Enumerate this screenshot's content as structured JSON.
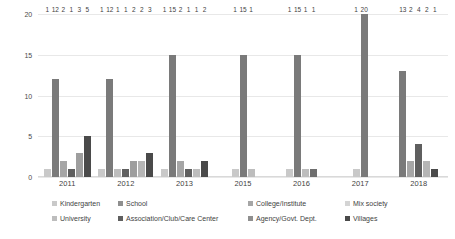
{
  "chart_data": {
    "type": "bar",
    "title": "",
    "xlabel": "",
    "ylabel": "",
    "ylim": [
      0,
      20
    ],
    "yticks": [
      "0",
      "5",
      "10",
      "15",
      "20"
    ],
    "grid": true,
    "legend_position": "bottom",
    "categories": [
      "2011",
      "2012",
      "2013",
      "2015",
      "2016",
      "2017",
      "2018"
    ],
    "series": [
      {
        "name": "Kindergarten",
        "color": "#c9c9c9",
        "values": [
          1,
          1,
          1,
          1,
          1,
          1,
          0
        ]
      },
      {
        "name": "School",
        "color": "#7a7a7a",
        "values": [
          12,
          12,
          15,
          15,
          15,
          20,
          13
        ]
      },
      {
        "name": "College/Institute",
        "color": "#a6a6a6",
        "values": [
          2,
          1,
          2,
          1,
          1,
          0,
          2
        ]
      },
      {
        "name": "Mix society",
        "color": "#d4d4d4",
        "values": [
          0,
          0,
          0,
          0,
          0,
          0,
          0
        ]
      },
      {
        "name": "University",
        "color": "#bdbdbd",
        "values": [
          0,
          0,
          0,
          0,
          0,
          0,
          0
        ]
      },
      {
        "name": "Association/Club/Care Center",
        "color": "#6e6e6e",
        "values": [
          1,
          1,
          1,
          0,
          1,
          0,
          4
        ]
      },
      {
        "name": "Agency/Govt. Dept.",
        "color": "#8f8f8f",
        "values": [
          3,
          2,
          1,
          0,
          0,
          0,
          2
        ]
      },
      {
        "name": "Villages",
        "color": "#4a4a4a",
        "values": [
          5,
          3,
          2,
          0,
          0,
          0,
          1
        ]
      }
    ],
    "groups": [
      {
        "category": "2011",
        "bars": [
          {
            "series": "Kindergarten",
            "value": 1,
            "color": "#c9c9c9"
          },
          {
            "series": "School",
            "value": 12,
            "color": "#7a7a7a"
          },
          {
            "series": "College/Institute",
            "value": 2,
            "color": "#a6a6a6"
          },
          {
            "series": "Association/Club/Care Center",
            "value": 1,
            "color": "#5f5f5f"
          },
          {
            "series": "Agency/Govt. Dept.",
            "value": 3,
            "color": "#9e9e9e"
          },
          {
            "series": "Villages",
            "value": 5,
            "color": "#4a4a4a"
          }
        ]
      },
      {
        "category": "2012",
        "bars": [
          {
            "series": "Kindergarten",
            "value": 1,
            "color": "#c9c9c9"
          },
          {
            "series": "School",
            "value": 12,
            "color": "#7a7a7a"
          },
          {
            "series": "College/Institute",
            "value": 1,
            "color": "#bdbdbd"
          },
          {
            "series": "Association/Club/Care Center",
            "value": 1,
            "color": "#5f5f5f"
          },
          {
            "series": "Agency/Govt. Dept.",
            "value": 2,
            "color": "#9e9e9e"
          },
          {
            "series": "Mix society",
            "value": 2,
            "color": "#b5b5b5"
          },
          {
            "series": "Villages",
            "value": 3,
            "color": "#4a4a4a"
          }
        ]
      },
      {
        "category": "2013",
        "bars": [
          {
            "series": "Kindergarten",
            "value": 1,
            "color": "#c9c9c9"
          },
          {
            "series": "School",
            "value": 15,
            "color": "#7a7a7a"
          },
          {
            "series": "College/Institute",
            "value": 2,
            "color": "#a6a6a6"
          },
          {
            "series": "Association/Club/Care Center",
            "value": 1,
            "color": "#5f5f5f"
          },
          {
            "series": "Agency/Govt. Dept.",
            "value": 1,
            "color": "#bdbdbd"
          },
          {
            "series": "Villages",
            "value": 2,
            "color": "#4a4a4a"
          }
        ]
      },
      {
        "category": "2015",
        "bars": [
          {
            "series": "Kindergarten",
            "value": 1,
            "color": "#c9c9c9"
          },
          {
            "series": "School",
            "value": 15,
            "color": "#7a7a7a"
          },
          {
            "series": "College/Institute",
            "value": 1,
            "color": "#bdbdbd"
          }
        ]
      },
      {
        "category": "2016",
        "bars": [
          {
            "series": "Kindergarten",
            "value": 1,
            "color": "#c9c9c9"
          },
          {
            "series": "School",
            "value": 15,
            "color": "#7a7a7a"
          },
          {
            "series": "College/Institute",
            "value": 1,
            "color": "#bdbdbd"
          },
          {
            "series": "Association/Club/Care Center",
            "value": 1,
            "color": "#6e6e6e"
          }
        ]
      },
      {
        "category": "2017",
        "bars": [
          {
            "series": "Kindergarten",
            "value": 1,
            "color": "#c9c9c9"
          },
          {
            "series": "School",
            "value": 20,
            "color": "#7a7a7a"
          }
        ]
      },
      {
        "category": "2018",
        "bars": [
          {
            "series": "School",
            "value": 13,
            "color": "#7a7a7a"
          },
          {
            "series": "College/Institute",
            "value": 2,
            "color": "#a6a6a6"
          },
          {
            "series": "Association/Club/Care Center",
            "value": 4,
            "color": "#5f5f5f"
          },
          {
            "series": "Agency/Govt. Dept.",
            "value": 2,
            "color": "#b5b5b5"
          },
          {
            "series": "Villages",
            "value": 1,
            "color": "#4a4a4a"
          }
        ]
      }
    ]
  },
  "legend": {
    "row1": [
      {
        "label": "Kindergarten",
        "color": "#c9c9c9",
        "left": 52
      },
      {
        "label": "School",
        "color": "#8f8f8f",
        "left": 118
      },
      {
        "label": "College/Institute",
        "color": "#a6a6a6",
        "left": 248
      },
      {
        "label": "Mix society",
        "color": "#d4d4d4",
        "left": 345
      }
    ],
    "row2": [
      {
        "label": "University",
        "color": "#bdbdbd",
        "left": 52
      },
      {
        "label": "Association/Club/Care Center",
        "color": "#5f5f5f",
        "left": 118
      },
      {
        "label": "Agency/Govt. Dept.",
        "color": "#8f8f8f",
        "left": 248
      },
      {
        "label": "Villages",
        "color": "#4a4a4a",
        "left": 345
      }
    ]
  }
}
